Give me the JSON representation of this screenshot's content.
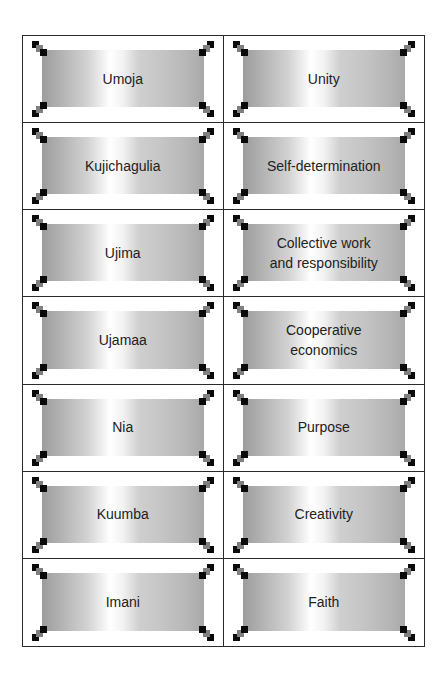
{
  "colors": {
    "border": "#2a2a2a",
    "text": "#222222",
    "ornament_dark": "#0a0a0a",
    "ornament_gray": "#808080"
  },
  "cards": [
    {
      "term": "Umoja",
      "meaning": "Unity"
    },
    {
      "term": "Kujichagulia",
      "meaning": "Self-determination"
    },
    {
      "term": "Ujima",
      "meaning": "Collective work\nand responsibility"
    },
    {
      "term": "Ujamaa",
      "meaning": "Cooperative\neconomics"
    },
    {
      "term": "Nia",
      "meaning": "Purpose"
    },
    {
      "term": "Kuumba",
      "meaning": "Creativity"
    },
    {
      "term": "Imani",
      "meaning": "Faith"
    }
  ]
}
